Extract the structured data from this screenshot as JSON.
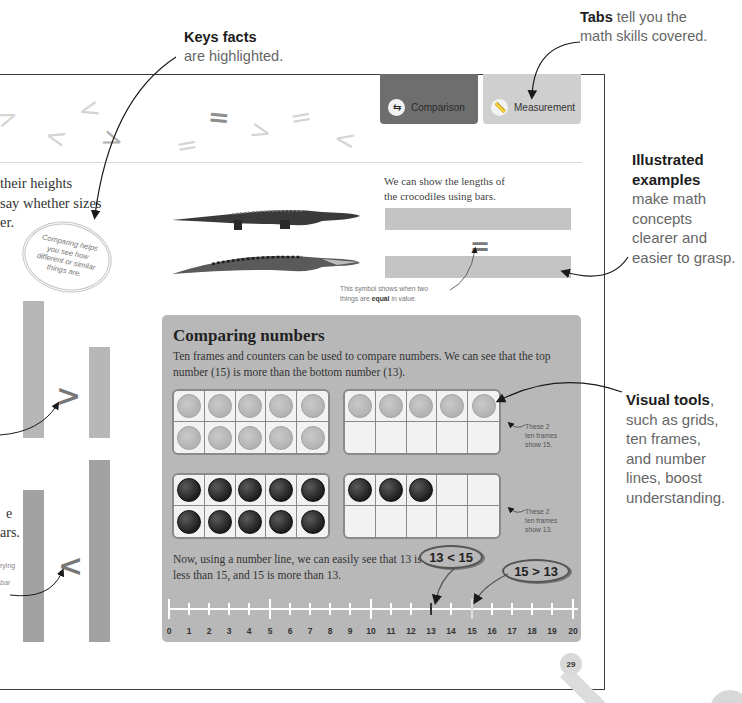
{
  "annotations": {
    "key_facts": {
      "bold": "Keys facts",
      "text": "are highlighted."
    },
    "tabs": {
      "bold": "Tabs",
      "text_1": " tell you the",
      "text_2": "math skills covered."
    },
    "illustrated": {
      "bold_1": "Illustrated",
      "bold_2": "examples",
      "lines": [
        "make math",
        "concepts",
        "clearer and",
        "easier to grasp."
      ]
    },
    "visual_tools": {
      "bold": "Visual tools",
      "comma": ",",
      "lines": [
        "such as grids,",
        "ten frames,",
        "and number",
        "lines, boost",
        "understanding."
      ]
    }
  },
  "tabs": [
    {
      "label": "Comparison",
      "icon": "arrows-compare-icon",
      "color": "#6e6e6e"
    },
    {
      "label": "Measurement",
      "icon": "ruler-icon",
      "color": "#cfcfcf"
    }
  ],
  "intro": {
    "lines": [
      "their heights",
      "say whether sizes",
      "er."
    ],
    "bubble": "Comparing helps you see how different or similar things are."
  },
  "left_bars": {
    "greater_symbol": ">",
    "less_symbol": "<",
    "partial_text": [
      "e",
      "ars."
    ],
    "partial_small": [
      "rying",
      "bar"
    ]
  },
  "crocodiles": {
    "text_1": "We can show the lengths of",
    "text_2": "the crocodiles using bars.",
    "equal_symbol": "=",
    "caption_1": "This symbol shows when two",
    "caption_2a": "things are ",
    "caption_2b": "equal",
    "caption_2c": " in value."
  },
  "decorative_symbols": [
    ">",
    "<",
    "<",
    ">",
    "=",
    "=",
    ">",
    "=",
    "<"
  ],
  "comparing_numbers": {
    "title": "Comparing numbers",
    "description": "Ten frames and counters can be used to compare numbers. We can see that the top number (15) is more than the bottom number (13).",
    "top_frames": {
      "count": 15,
      "note": [
        "These 2",
        "ten frames",
        "show 15."
      ]
    },
    "bottom_frames": {
      "count": 13,
      "note": [
        "These 2",
        "ten frames",
        "show 13."
      ]
    },
    "numberline_text": "Now, using a number line, we can easily see that 13 is less than 15, and 15 is more than 13.",
    "bubble_less": "13 < 15",
    "bubble_greater": "15 > 13",
    "numberline_labels": [
      "0",
      "1",
      "2",
      "3",
      "4",
      "5",
      "6",
      "7",
      "8",
      "9",
      "10",
      "11",
      "12",
      "13",
      "14",
      "15",
      "16",
      "17",
      "18",
      "19",
      "20"
    ]
  },
  "page_number": "29"
}
